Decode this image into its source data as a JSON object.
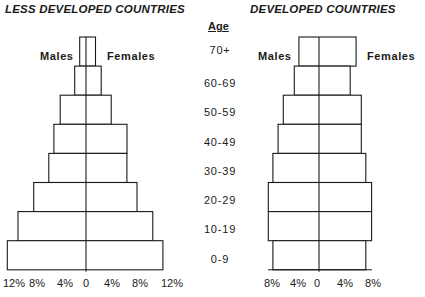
{
  "titles": {
    "left": "LESS DEVELOPED COUNTRIES",
    "right": "DEVELOPED COUNTRIES"
  },
  "age_header": "Age",
  "labels": {
    "males": "Males",
    "females": "Females"
  },
  "chart_data": [
    {
      "type": "bar",
      "subtype": "population-pyramid",
      "title": "LESS DEVELOPED COUNTRIES",
      "categories": [
        "70+",
        "60-69",
        "50-59",
        "40-49",
        "30-39",
        "20-29",
        "10-19",
        "0-9"
      ],
      "series": [
        {
          "name": "Males",
          "values": [
            1.0,
            1.8,
            4.1,
            5.1,
            5.9,
            8.3,
            10.8,
            12.5
          ]
        },
        {
          "name": "Females",
          "values": [
            1.5,
            2.4,
            4.0,
            6.5,
            6.5,
            8.1,
            10.6,
            12.2
          ]
        }
      ],
      "xlabel": "",
      "ylabel": "Age",
      "x_ticks": [
        "12%",
        "8%",
        "4%",
        "0",
        "4%",
        "8%",
        "12%"
      ],
      "xlim": [
        -12,
        12
      ],
      "grid": false,
      "legend": "inline labels (Males left, Females right)"
    },
    {
      "type": "bar",
      "subtype": "population-pyramid",
      "title": "DEVELOPED COUNTRIES",
      "categories": [
        "70+",
        "60-69",
        "50-59",
        "40-49",
        "30-39",
        "20-29",
        "10-19",
        "0-9"
      ],
      "series": [
        {
          "name": "Males",
          "values": [
            3.1,
            3.8,
            5.5,
            6.3,
            7.1,
            7.8,
            7.8,
            7.1
          ]
        },
        {
          "name": "Females",
          "values": [
            5.7,
            4.8,
            6.5,
            6.5,
            7.2,
            8.1,
            8.1,
            7.2
          ]
        }
      ],
      "xlabel": "",
      "ylabel": "Age",
      "x_ticks": [
        "8%",
        "4%",
        "0",
        "4%",
        "8%"
      ],
      "xlim": [
        -8,
        8
      ],
      "grid": false,
      "legend": "inline labels (Males left, Females right)"
    }
  ]
}
